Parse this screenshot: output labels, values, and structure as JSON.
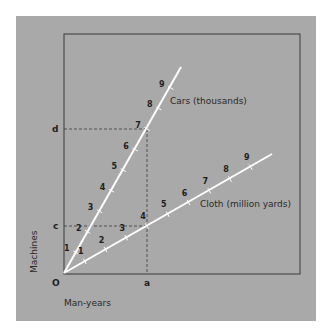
{
  "diagram": {
    "colors": {
      "panel": "#a9a9a9",
      "frame": "#3a3a3a",
      "rays": "#ffffff",
      "dashes": "#3a3a3a",
      "text": "#1e1e1e"
    },
    "origin_label": "O",
    "x_axis_label": "Man-years",
    "y_axis_label": "Machines",
    "x_marker": "a",
    "y_markers": [
      "c",
      "d"
    ],
    "rays": [
      {
        "name": "Cars (thousands)",
        "ticks": [
          "1",
          "2",
          "3",
          "4",
          "5",
          "6",
          "7",
          "8",
          "9"
        ],
        "intersect_tick": "7"
      },
      {
        "name": "Cloth (million yards)",
        "ticks": [
          "1",
          "2",
          "3",
          "4",
          "5",
          "6",
          "7",
          "8",
          "9"
        ],
        "intersect_tick": "4"
      }
    ]
  }
}
